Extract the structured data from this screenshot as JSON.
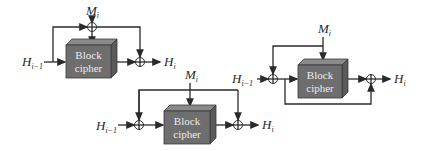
{
  "diagram": {
    "block_label_line1": "Block",
    "block_label_line2": "cipher",
    "colors": {
      "block_front": "#6e6e6e",
      "block_top": "#8a8a8a",
      "block_side": "#5a5a5a",
      "line": "#2a2a2a"
    },
    "schemes": [
      {
        "id": "scheme-1",
        "input": {
          "base": "H",
          "sub": "i−1"
        },
        "message": {
          "base": "M",
          "sub": "i"
        },
        "output": {
          "base": "H",
          "sub": "i"
        }
      },
      {
        "id": "scheme-2",
        "input": {
          "base": "H",
          "sub": "i−1"
        },
        "message": {
          "base": "M",
          "sub": "i"
        },
        "output": {
          "base": "H",
          "sub": "i"
        }
      },
      {
        "id": "scheme-3",
        "input": {
          "base": "H",
          "sub": "i−1"
        },
        "message": {
          "base": "M",
          "sub": "i"
        },
        "output": {
          "base": "H",
          "sub": "i"
        }
      }
    ]
  }
}
